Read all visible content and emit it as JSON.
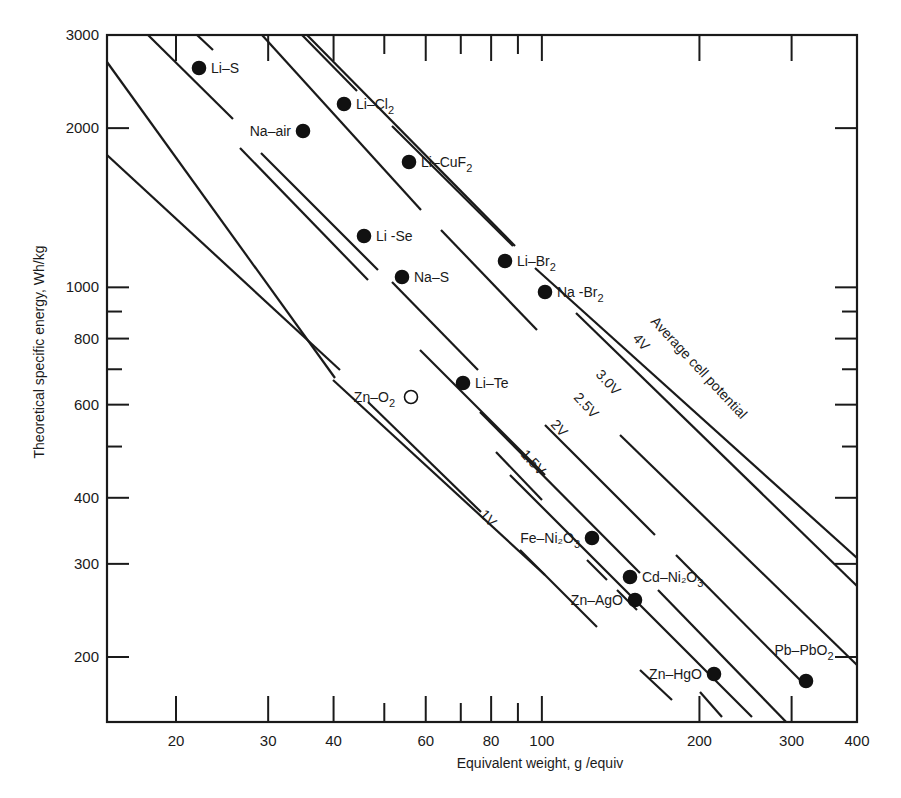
{
  "chart_data": {
    "type": "scatter",
    "title": "",
    "xlabel": "Equivalent weight, g /equiv",
    "ylabel": "Theoretical specific energy, Wh/kg",
    "xscale": "log",
    "yscale": "log",
    "xlim": [
      14,
      400
    ],
    "ylim": [
      150,
      3000
    ],
    "grid": false,
    "x_ticks": [
      {
        "value": 20,
        "label": "20",
        "major": true
      },
      {
        "value": 30,
        "label": "30",
        "major": true
      },
      {
        "value": 40,
        "label": "40",
        "major": true
      },
      {
        "value": 50,
        "label": "",
        "major": false
      },
      {
        "value": 60,
        "label": "60",
        "major": true
      },
      {
        "value": 70,
        "label": "",
        "major": false
      },
      {
        "value": 80,
        "label": "80",
        "major": true
      },
      {
        "value": 90,
        "label": "",
        "major": false
      },
      {
        "value": 100,
        "label": "100",
        "major": true
      },
      {
        "value": 200,
        "label": "200",
        "major": true
      },
      {
        "value": 300,
        "label": "300",
        "major": true
      },
      {
        "value": 400,
        "label": "400",
        "major": true
      }
    ],
    "y_ticks": [
      {
        "value": 200,
        "label": "200",
        "major": true
      },
      {
        "value": 300,
        "label": "300",
        "major": true
      },
      {
        "value": 400,
        "label": "400",
        "major": true
      },
      {
        "value": 500,
        "label": "",
        "major": false
      },
      {
        "value": 600,
        "label": "600",
        "major": true
      },
      {
        "value": 700,
        "label": "",
        "major": false
      },
      {
        "value": 800,
        "label": "800",
        "major": true
      },
      {
        "value": 900,
        "label": "",
        "major": false
      },
      {
        "value": 1000,
        "label": "1000",
        "major": true
      },
      {
        "value": 2000,
        "label": "2000",
        "major": true
      },
      {
        "value": 3000,
        "label": "3000",
        "major": true
      }
    ],
    "points": [
      {
        "name": "Li-S",
        "label": "Li–S",
        "sub": "",
        "x": 19,
        "y": 2600,
        "filled": true
      },
      {
        "name": "Li-Cl2",
        "label": "Li–Cl",
        "sub": "2",
        "x": 41,
        "y": 2200,
        "filled": true
      },
      {
        "name": "Na-air",
        "label": "Na–air",
        "sub": "",
        "x": 35,
        "y": 1950,
        "filled": true
      },
      {
        "name": "Li-CuF2",
        "label": "Li–CuF",
        "sub": "2",
        "x": 57,
        "y": 1750,
        "filled": true
      },
      {
        "name": "Li-Se",
        "label": "Li -Se",
        "sub": "",
        "x": 46,
        "y": 1200,
        "filled": true
      },
      {
        "name": "Li-Br2",
        "label": "Li–Br",
        "sub": "2",
        "x": 87,
        "y": 1100,
        "filled": true
      },
      {
        "name": "Na-S",
        "label": "Na–S",
        "sub": "",
        "x": 55,
        "y": 1040,
        "filled": true
      },
      {
        "name": "Na-Br2",
        "label": "Na -Br",
        "sub": "2",
        "x": 103,
        "y": 970,
        "filled": true
      },
      {
        "name": "Li-Te",
        "label": "Li–Te",
        "sub": "",
        "x": 71,
        "y": 650,
        "filled": true
      },
      {
        "name": "Zn-O2",
        "label": "Zn–O",
        "sub": "2",
        "x": 47,
        "y": 600,
        "filled": false
      },
      {
        "name": "Fe-Ni2O3",
        "label": "Fe–Ni₂O",
        "sub": "3",
        "x": 132,
        "y": 335,
        "filled": true
      },
      {
        "name": "Cd-Ni2O3",
        "label": "Cd–Ni₂O",
        "sub": "3",
        "x": 157,
        "y": 280,
        "filled": true
      },
      {
        "name": "Zn-AgO",
        "label": "Zn–AgO",
        "sub": "",
        "x": 160,
        "y": 255,
        "filled": true
      },
      {
        "name": "Zn-HgO",
        "label": "Zn–HgO",
        "sub": "",
        "x": 215,
        "y": 183,
        "filled": true
      },
      {
        "name": "Pb-PbO2",
        "label": "Pb–PbO",
        "sub": "2",
        "x": 320,
        "y": 178,
        "filled": true
      }
    ],
    "potential_lines": [
      {
        "label": "1V",
        "value_v": 1.0
      },
      {
        "label": "1.5V",
        "value_v": 1.5
      },
      {
        "label": "2V",
        "value_v": 2.0
      },
      {
        "label": "2.5V",
        "value_v": 2.5
      },
      {
        "label": "3.0V",
        "value_v": 3.0
      },
      {
        "label": "4V",
        "value_v": 4.0
      }
    ],
    "annotations": [
      {
        "text": "Average cell potential"
      }
    ]
  }
}
